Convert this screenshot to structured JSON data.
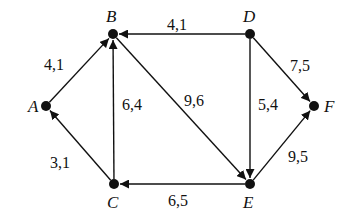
{
  "diagram": {
    "type": "directed-weighted-graph",
    "nodes": [
      {
        "id": "A",
        "label": "A",
        "x": 46,
        "y": 106,
        "lx": 28,
        "ly": 112
      },
      {
        "id": "B",
        "label": "B",
        "x": 113,
        "y": 34,
        "lx": 106,
        "ly": 22
      },
      {
        "id": "C",
        "label": "C",
        "x": 114,
        "y": 184,
        "lx": 107,
        "ly": 208
      },
      {
        "id": "D",
        "label": "D",
        "x": 250,
        "y": 34,
        "lx": 243,
        "ly": 22
      },
      {
        "id": "E",
        "label": "E",
        "x": 250,
        "y": 184,
        "lx": 243,
        "ly": 208
      },
      {
        "id": "F",
        "label": "F",
        "x": 314,
        "y": 106,
        "lx": 324,
        "ly": 112
      }
    ],
    "edges": [
      {
        "from": "A",
        "to": "B",
        "label": "4,1",
        "lx": 44,
        "ly": 70
      },
      {
        "from": "D",
        "to": "B",
        "label": "4,1",
        "lx": 167,
        "ly": 30
      },
      {
        "from": "D",
        "to": "F",
        "label": "7,5",
        "lx": 290,
        "ly": 71
      },
      {
        "from": "C",
        "to": "A",
        "label": "3,1",
        "lx": 50,
        "ly": 168
      },
      {
        "from": "C",
        "to": "B",
        "label": "6,4",
        "lx": 122,
        "ly": 110
      },
      {
        "from": "B",
        "to": "E",
        "label": "9,6",
        "lx": 184,
        "ly": 106
      },
      {
        "from": "D",
        "to": "E",
        "label": "5,4",
        "lx": 258,
        "ly": 110
      },
      {
        "from": "E",
        "to": "C",
        "label": "6,5",
        "lx": 168,
        "ly": 206
      },
      {
        "from": "E",
        "to": "F",
        "label": "9,5",
        "lx": 288,
        "ly": 162
      }
    ]
  }
}
